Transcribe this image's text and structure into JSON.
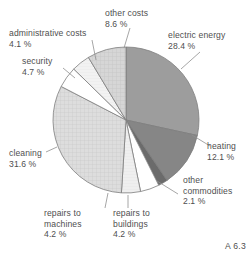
{
  "figure": {
    "id_label": "A 6.3"
  },
  "chart_data": {
    "type": "pie",
    "title": "",
    "xlabel": "",
    "ylabel": "",
    "unit": "%",
    "start_angle_deg": 0,
    "direction": "clockwise",
    "center": [
      126,
      120
    ],
    "radius": 73,
    "legend_position": "outside-labels-with-leader-lines",
    "grid": false,
    "categories": [
      "electric energy",
      "heating",
      "other commodities",
      "repairs to buildings",
      "repairs to machines",
      "cleaning",
      "security",
      "administrative costs",
      "other costs"
    ],
    "values": [
      28.4,
      12.1,
      2.1,
      4.2,
      4.2,
      31.6,
      4.7,
      4.1,
      8.6
    ],
    "value_labels": [
      "28.4 %",
      "12.1 %",
      "2.1 %",
      "4.2 %",
      "4.2 %",
      "31.6 %",
      "4.7 %",
      "4.1 %",
      "8.6 %"
    ],
    "colors": [
      "#9d9d9d",
      "#868686",
      "#6b6b6b",
      "#ffffff",
      "#ececec",
      "#d9d9d9",
      "#ffffff",
      "#f1f1f1",
      "#d2d2d2"
    ],
    "slices": [
      {
        "name": "electric energy",
        "value": 28.4,
        "label": "electric energy",
        "pct_text": "28.4 %",
        "color": "#9d9d9d",
        "pattern": "solid"
      },
      {
        "name": "heating",
        "value": 12.1,
        "label": "heating",
        "pct_text": "12.1 %",
        "color": "#868686",
        "pattern": "solid"
      },
      {
        "name": "other commodities",
        "value": 2.1,
        "label": "other commodities",
        "pct_text": "2.1 %",
        "color": "#6b6b6b",
        "pattern": "solid"
      },
      {
        "name": "repairs to buildings",
        "value": 4.2,
        "label": "repairs to buildings",
        "pct_text": "4.2 %",
        "color": "#ffffff",
        "pattern": "plain"
      },
      {
        "name": "repairs to machines",
        "value": 4.2,
        "label": "repairs to machines",
        "pct_text": "4.2 %",
        "color": "#ececec",
        "pattern": "fine-hatch"
      },
      {
        "name": "cleaning",
        "value": 31.6,
        "label": "cleaning",
        "pct_text": "31.6 %",
        "color": "#d9d9d9",
        "pattern": "crosshatch"
      },
      {
        "name": "security",
        "value": 4.7,
        "label": "security",
        "pct_text": "4.7 %",
        "color": "#ffffff",
        "pattern": "plain"
      },
      {
        "name": "administrative costs",
        "value": 4.1,
        "label": "administrative costs",
        "pct_text": "4.1 %",
        "color": "#f1f1f1",
        "pattern": "fine-hatch"
      },
      {
        "name": "other costs",
        "value": 8.6,
        "label": "other costs",
        "pct_text": "8.6 %",
        "color": "#d2d2d2",
        "pattern": "crosshatch"
      }
    ]
  },
  "labels": {
    "electric_energy": {
      "name": "electric energy",
      "pct": "28.4 %"
    },
    "heating": {
      "name": "heating",
      "pct": "12.1 %"
    },
    "other_commodities": {
      "name": "other",
      "name2": "commodities",
      "pct": "2.1 %"
    },
    "repairs_buildings": {
      "name": "repairs to",
      "name2": "buildings",
      "pct": "4.2 %"
    },
    "repairs_machines": {
      "name": "repairs to",
      "name2": "machines",
      "pct": "4.2 %"
    },
    "cleaning": {
      "name": "cleaning",
      "pct": "31.6 %"
    },
    "security": {
      "name": "security",
      "pct": "4.7 %"
    },
    "administrative_costs": {
      "name": "administrative costs",
      "pct": "4.1 %"
    },
    "other_costs": {
      "name": "other costs",
      "pct": "8.6 %"
    }
  }
}
